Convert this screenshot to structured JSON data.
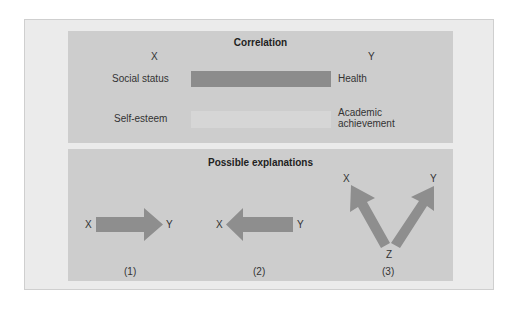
{
  "correlation": {
    "title": "Correlation",
    "x_header": "X",
    "y_header": "Y",
    "rows": [
      {
        "x_label": "Social status",
        "y_label": "Health",
        "bar_color": "#8c8c8c",
        "strength": "strong"
      },
      {
        "x_label": "Self-esteem",
        "y_label_line1": "Academic",
        "y_label_line2": "achievement",
        "bar_color": "#d6d6d6",
        "strength": "weak"
      }
    ]
  },
  "explanations": {
    "title": "Possible explanations",
    "arrow_color": "#8e8e8e",
    "items": [
      {
        "number": "(1)",
        "from": "X",
        "to": "Y",
        "direction": "right"
      },
      {
        "number": "(2)",
        "from": "Y",
        "to": "X",
        "direction": "left",
        "left_label": "X",
        "right_label": "Y"
      },
      {
        "number": "(3)",
        "source": "Z",
        "targets": [
          "X",
          "Y"
        ],
        "left_label": "X",
        "right_label": "Y",
        "bottom_label": "Z"
      }
    ]
  },
  "colors": {
    "frame_bg": "#ebebeb",
    "panel_bg": "#cdcdcd",
    "strong_bar": "#8c8c8c",
    "weak_bar": "#d6d6d6",
    "arrow": "#8e8e8e"
  }
}
